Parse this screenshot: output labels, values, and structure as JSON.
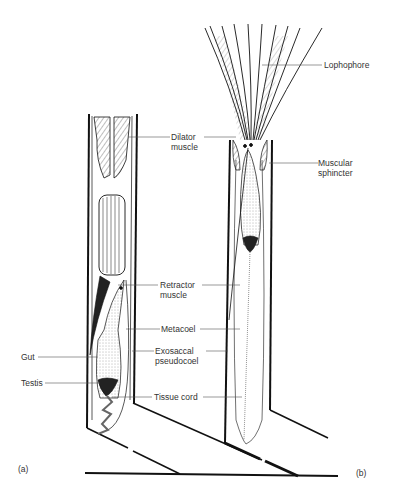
{
  "figure": {
    "panels": [
      {
        "id": "a",
        "label": "(a)"
      },
      {
        "id": "b",
        "label": "(b)"
      }
    ],
    "labels": {
      "lophophore": "Lophophore",
      "dilator_1": "Dilator",
      "dilator_2": "muscle",
      "sphincter_1": "Muscular",
      "sphincter_2": "sphincter",
      "retractor_1": "Retractor",
      "retractor_2": "muscle",
      "metacoel": "Metacoel",
      "exosaccal_1": "Exosaccal",
      "exosaccal_2": "pseudocoel",
      "gut": "Gut",
      "testis": "Testis",
      "tissue_cord": "Tissue cord"
    },
    "colors": {
      "line": "#1a1a1a",
      "text": "#333333",
      "background": "#ffffff"
    }
  }
}
